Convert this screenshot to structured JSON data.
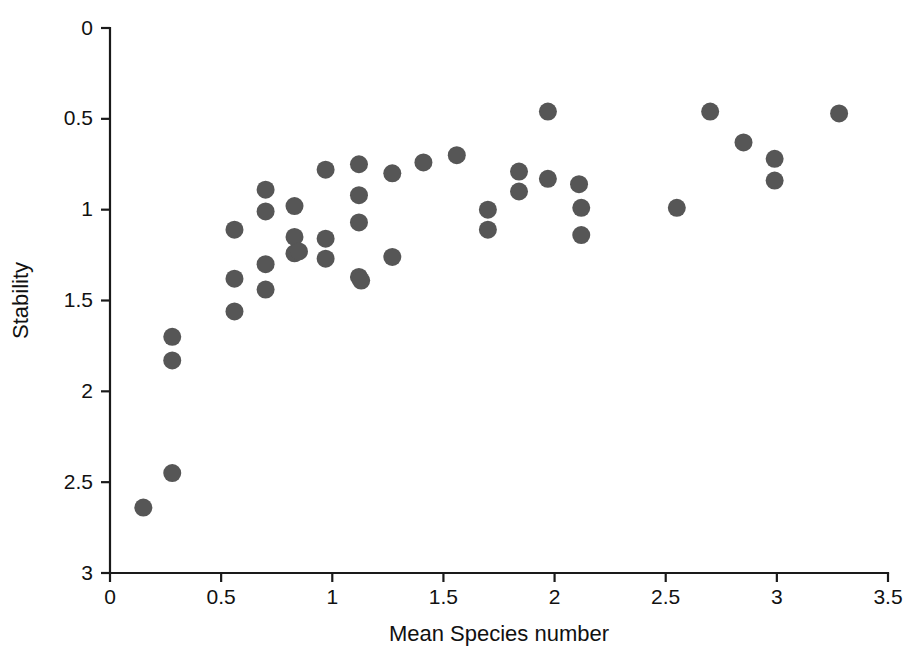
{
  "chart_data": {
    "type": "scatter",
    "title": "",
    "xlabel": "Mean Species number",
    "ylabel": "Stability",
    "xlim": [
      0,
      3.5
    ],
    "ylim": [
      0,
      3
    ],
    "y_axis_inverted": true,
    "grid": false,
    "legend": null,
    "xticks": [
      0,
      0.5,
      1,
      1.5,
      2,
      2.5,
      3,
      3.5
    ],
    "xtick_labels": [
      "0",
      "0.5",
      "1",
      "1.5",
      "2",
      "2.5",
      "3",
      "3.5"
    ],
    "yticks": [
      0,
      0.5,
      1,
      1.5,
      2,
      2.5,
      3
    ],
    "ytick_labels": [
      "0",
      "0.5",
      "1",
      "1.5",
      "2",
      "2.5",
      "3"
    ],
    "marker": "circle",
    "marker_color": "#565656",
    "marker_size_px": 18,
    "n_points": 42,
    "points": [
      {
        "x": 0.15,
        "y": 2.64
      },
      {
        "x": 0.28,
        "y": 2.45
      },
      {
        "x": 0.28,
        "y": 1.7
      },
      {
        "x": 0.28,
        "y": 1.83
      },
      {
        "x": 0.56,
        "y": 1.11
      },
      {
        "x": 0.56,
        "y": 1.38
      },
      {
        "x": 0.56,
        "y": 1.56
      },
      {
        "x": 0.7,
        "y": 0.89
      },
      {
        "x": 0.7,
        "y": 1.01
      },
      {
        "x": 0.7,
        "y": 1.3
      },
      {
        "x": 0.7,
        "y": 1.44
      },
      {
        "x": 0.83,
        "y": 0.98
      },
      {
        "x": 0.83,
        "y": 1.15
      },
      {
        "x": 0.83,
        "y": 1.24
      },
      {
        "x": 0.85,
        "y": 1.23
      },
      {
        "x": 0.97,
        "y": 0.78
      },
      {
        "x": 0.97,
        "y": 1.16
      },
      {
        "x": 0.97,
        "y": 1.27
      },
      {
        "x": 1.12,
        "y": 0.75
      },
      {
        "x": 1.12,
        "y": 0.92
      },
      {
        "x": 1.12,
        "y": 1.07
      },
      {
        "x": 1.12,
        "y": 1.37
      },
      {
        "x": 1.13,
        "y": 1.39
      },
      {
        "x": 1.27,
        "y": 1.26
      },
      {
        "x": 1.27,
        "y": 0.8
      },
      {
        "x": 1.41,
        "y": 0.74
      },
      {
        "x": 1.56,
        "y": 0.7
      },
      {
        "x": 1.7,
        "y": 1.0
      },
      {
        "x": 1.7,
        "y": 1.11
      },
      {
        "x": 1.84,
        "y": 0.79
      },
      {
        "x": 1.84,
        "y": 0.9
      },
      {
        "x": 1.97,
        "y": 0.46
      },
      {
        "x": 1.97,
        "y": 0.83
      },
      {
        "x": 2.11,
        "y": 0.86
      },
      {
        "x": 2.12,
        "y": 0.99
      },
      {
        "x": 2.12,
        "y": 1.14
      },
      {
        "x": 2.55,
        "y": 0.99
      },
      {
        "x": 2.7,
        "y": 0.46
      },
      {
        "x": 2.85,
        "y": 0.63
      },
      {
        "x": 2.99,
        "y": 0.72
      },
      {
        "x": 2.99,
        "y": 0.84
      },
      {
        "x": 3.28,
        "y": 0.47
      }
    ]
  },
  "axes": {
    "x_title": "Mean Species number",
    "y_title": "Stability"
  }
}
